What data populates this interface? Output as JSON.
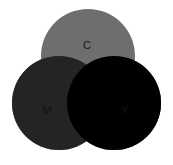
{
  "figure": {
    "name": "cmy-subtractive-venn-diagram",
    "width": 173,
    "height": 165,
    "background_color": "#ffffff"
  },
  "chart_data": {
    "type": "venn",
    "title": "",
    "subtitle": "",
    "xlabel": "",
    "ylabel": "",
    "grid": false,
    "legend": "none",
    "blend_mode": "multiply-subtractive",
    "set_count": 3,
    "sets": [
      {
        "id": "C",
        "label": "C",
        "name": "cyan",
        "color": "#6e6e6e",
        "cx": 88,
        "cy": 56,
        "r": 47,
        "label_x": 87,
        "label_y": 46,
        "label_color": "#1a1a1a"
      },
      {
        "id": "M",
        "label": "M",
        "name": "magenta",
        "color": "#555555",
        "cx": 59,
        "cy": 103,
        "r": 47,
        "label_x": 47,
        "label_y": 111,
        "label_color": "#141414"
      },
      {
        "id": "Y",
        "label": "Y",
        "name": "yellow",
        "color": "#e3e3e3",
        "cx": 114,
        "cy": 103,
        "r": 47,
        "label_x": 125,
        "label_y": 111,
        "label_color": "#141414"
      }
    ],
    "intersections": [
      {
        "id": "CM",
        "sets": [
          "C",
          "M"
        ],
        "label": "",
        "color": "#242424"
      },
      {
        "id": "CY",
        "sets": [
          "C",
          "Y"
        ],
        "label": "",
        "color": "#626262"
      },
      {
        "id": "MY",
        "sets": [
          "M",
          "Y"
        ],
        "label": "",
        "color": "#4b4b4b"
      },
      {
        "id": "CMY",
        "sets": [
          "C",
          "M",
          "Y"
        ],
        "label": "",
        "color": "#000000"
      }
    ]
  }
}
